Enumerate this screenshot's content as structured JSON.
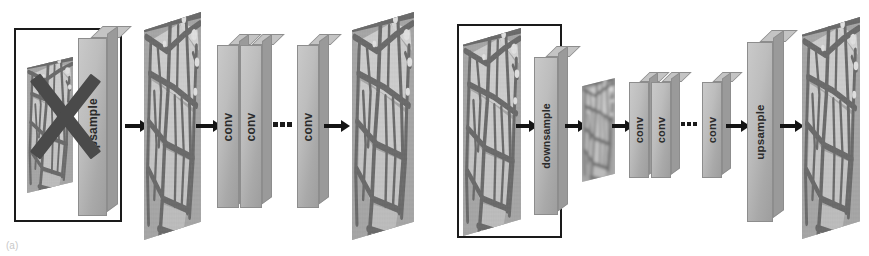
{
  "figure": {
    "type": "diagram",
    "background_color": "#ffffff",
    "slab_color": "#bdbdbd",
    "slab_edge_color": "#8d8d8d",
    "arrow_color": "#141414",
    "box_color": "#1a1a1a",
    "cross_color": "#4a4a4a"
  },
  "panels": [
    {
      "id": "panel-a",
      "label": "(a)",
      "highlight_box": {
        "present": true,
        "crossed_out": true
      },
      "stages": [
        {
          "kind": "image-plane",
          "name": "input-image",
          "size": "large"
        },
        {
          "kind": "slab",
          "name": "upsample-block",
          "label": "upsample"
        },
        {
          "kind": "arrow",
          "name": "arrow-1"
        },
        {
          "kind": "image-plane",
          "name": "upsampled-image",
          "size": "large"
        },
        {
          "kind": "arrow",
          "name": "arrow-2"
        },
        {
          "kind": "slab",
          "name": "conv-block-1",
          "label": "conv"
        },
        {
          "kind": "slab",
          "name": "conv-block-2",
          "label": "conv"
        },
        {
          "kind": "dots",
          "name": "ellipsis"
        },
        {
          "kind": "slab",
          "name": "conv-block-n",
          "label": "conv"
        },
        {
          "kind": "arrow",
          "name": "arrow-3"
        },
        {
          "kind": "image-plane",
          "name": "output-image",
          "size": "large"
        }
      ]
    },
    {
      "id": "panel-b",
      "label": "(b)",
      "highlight_box": {
        "present": true,
        "crossed_out": false
      },
      "stages": [
        {
          "kind": "image-plane",
          "name": "input-image",
          "size": "large"
        },
        {
          "kind": "arrow",
          "name": "arrow-1"
        },
        {
          "kind": "slab",
          "name": "downsample-block",
          "label": "downsample"
        },
        {
          "kind": "arrow",
          "name": "arrow-2"
        },
        {
          "kind": "image-plane",
          "name": "downsampled-image",
          "size": "small"
        },
        {
          "kind": "arrow",
          "name": "arrow-3"
        },
        {
          "kind": "slab",
          "name": "conv-block-1",
          "label": "conv"
        },
        {
          "kind": "slab",
          "name": "conv-block-2",
          "label": "conv"
        },
        {
          "kind": "dots",
          "name": "ellipsis"
        },
        {
          "kind": "slab",
          "name": "conv-block-n",
          "label": "conv"
        },
        {
          "kind": "arrow",
          "name": "arrow-4"
        },
        {
          "kind": "slab",
          "name": "upsample-block",
          "label": "upsample"
        },
        {
          "kind": "arrow",
          "name": "arrow-5"
        },
        {
          "kind": "image-plane",
          "name": "output-image",
          "size": "large"
        }
      ]
    }
  ],
  "labels": {
    "upsample": "upsample",
    "downsample": "downsample",
    "conv": "conv",
    "ellipsis": "...",
    "caption_a": "(a)"
  }
}
